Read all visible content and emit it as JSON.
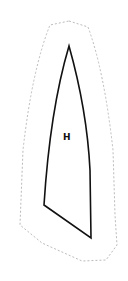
{
  "diagram": {
    "shape_label": "H",
    "outline_color": "#b8b8b8",
    "shape_stroke_color": "#111111",
    "background": "#ffffff"
  }
}
